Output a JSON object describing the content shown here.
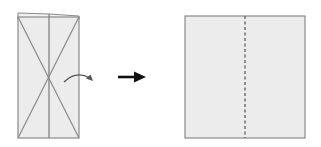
{
  "diagram": {
    "type": "origami-fold-step",
    "colors": {
      "background": "#ffffff",
      "paper_fill": "#ececec",
      "paper_edge": "#8a8a8a",
      "crease": "#8a8a8a",
      "arrow": "#111111",
      "fold_arrow": "#666666"
    },
    "before": {
      "shape": "tall rectangle with X diagonal creases and vertical center crease",
      "note": "top edge slightly offset layer"
    },
    "transition": {
      "icon": "right-arrow"
    },
    "fold_indicator": {
      "icon": "curved-fold-arrow"
    },
    "after": {
      "shape": "square with dashed vertical valley-fold line at center"
    }
  }
}
